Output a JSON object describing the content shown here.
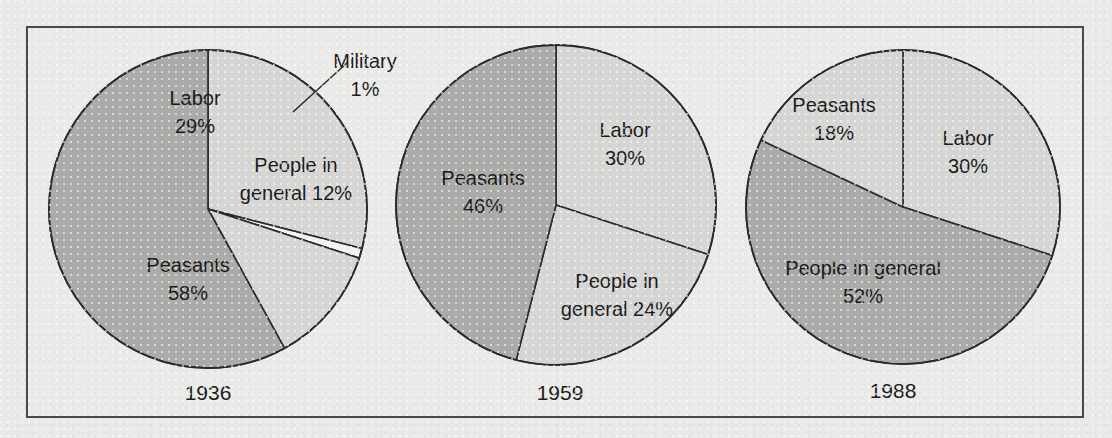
{
  "figure": {
    "background_color": "#e9e9e7",
    "frame_color": "#4a4a4a",
    "text_color": "#1c1c1c"
  },
  "palette": {
    "light_gray": "#d6d6d4",
    "medium_gray": "#ababa9",
    "white": "#f2f2f0",
    "outline": "#2b2b2b"
  },
  "chart_data": [
    {
      "type": "pie",
      "title": "1936",
      "start_angle_deg": 0,
      "direction": "clockwise",
      "legend": "none",
      "labels": [
        "Labor",
        "Military",
        "People in general",
        "Peasants"
      ],
      "values": [
        29,
        1,
        12,
        58
      ],
      "slices": [
        {
          "label": "Labor",
          "value_text": "29%",
          "value": 29,
          "fill": "light_gray",
          "label_line1": "Labor",
          "label_line2": "29%",
          "label_x": 195,
          "label_y": 105,
          "label_y2": 133,
          "anchor": "middle",
          "callout": false
        },
        {
          "label": "Military",
          "value_text": "1%",
          "value": 1,
          "fill": "white",
          "label_line1": "Military",
          "label_line2": "1%",
          "label_x": 365,
          "label_y": 68,
          "label_y2": 96,
          "anchor": "middle",
          "callout": true,
          "leader_x1": 293,
          "leader_y1": 112,
          "leader_x2": 348,
          "leader_y2": 62
        },
        {
          "label": "People in general",
          "value_text": "12%",
          "value": 12,
          "fill": "light_gray",
          "label_line1": "People in",
          "label_line2": "general 12%",
          "label_x": 296,
          "label_y": 172,
          "label_y2": 200,
          "anchor": "middle",
          "callout": false
        },
        {
          "label": "Peasants",
          "value_text": "58%",
          "value": 58,
          "fill": "medium_gray",
          "label_line1": "Peasants",
          "label_line2": "58%",
          "label_x": 188,
          "label_y": 272,
          "label_y2": 300,
          "anchor": "middle",
          "callout": false
        }
      ],
      "geometry": {
        "cx": 208,
        "cy": 209,
        "r": 159
      },
      "year_label_x": 208,
      "year_label_y": 400
    },
    {
      "type": "pie",
      "title": "1959",
      "start_angle_deg": 0,
      "direction": "clockwise",
      "legend": "none",
      "labels": [
        "Labor",
        "People in general",
        "Peasants"
      ],
      "values": [
        30,
        24,
        46
      ],
      "slices": [
        {
          "label": "Labor",
          "value_text": "30%",
          "value": 30,
          "fill": "light_gray",
          "label_line1": "Labor",
          "label_line2": "30%",
          "label_x": 625,
          "label_y": 137,
          "label_y2": 165,
          "anchor": "middle",
          "callout": false
        },
        {
          "label": "People in general",
          "value_text": "24%",
          "value": 24,
          "fill": "light_gray",
          "label_line1": "People in",
          "label_line2": "general 24%",
          "label_x": 617,
          "label_y": 288,
          "label_y2": 316,
          "anchor": "middle",
          "callout": false
        },
        {
          "label": "Peasants",
          "value_text": "46%",
          "value": 46,
          "fill": "medium_gray",
          "label_line1": "Peasants",
          "label_line2": "46%",
          "label_x": 483,
          "label_y": 185,
          "label_y2": 213,
          "anchor": "middle",
          "callout": false
        }
      ],
      "geometry": {
        "cx": 556,
        "cy": 205,
        "r": 160
      },
      "year_label_x": 560,
      "year_label_y": 400
    },
    {
      "type": "pie",
      "title": "1988",
      "start_angle_deg": 0,
      "direction": "clockwise",
      "legend": "none",
      "labels": [
        "Labor",
        "People in general",
        "Peasants"
      ],
      "values": [
        30,
        52,
        18
      ],
      "slices": [
        {
          "label": "Labor",
          "value_text": "30%",
          "value": 30,
          "fill": "light_gray",
          "label_line1": "Labor",
          "label_line2": "30%",
          "label_x": 968,
          "label_y": 145,
          "label_y2": 173,
          "anchor": "middle",
          "callout": false
        },
        {
          "label": "People in general",
          "value_text": "52%",
          "value": 52,
          "fill": "medium_gray",
          "label_line1": "People in general",
          "label_line2": "52%",
          "label_x": 863,
          "label_y": 275,
          "label_y2": 303,
          "anchor": "middle",
          "callout": false
        },
        {
          "label": "Peasants",
          "value_text": "18%",
          "value": 18,
          "fill": "light_gray",
          "label_line1": "Peasants",
          "label_line2": "18%",
          "label_x": 834,
          "label_y": 112,
          "label_y2": 140,
          "anchor": "middle",
          "callout": false
        }
      ],
      "geometry": {
        "cx": 903,
        "cy": 207,
        "r": 157
      },
      "year_label_x": 893,
      "year_label_y": 398
    }
  ]
}
